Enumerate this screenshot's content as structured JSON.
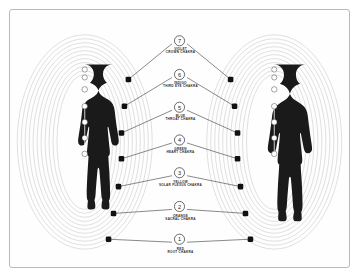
{
  "diagram": {
    "frame_color": "#b9b9bb",
    "background_color": "#fefefe",
    "silhouette_color": "#1a1a1a",
    "aura_line_color": "#c6c6c8",
    "leader_line_color": "#3a3a3a",
    "node_color": "#111111",
    "aura_ring_count": 11,
    "figures": [
      {
        "name": "female-figure",
        "position": "left"
      },
      {
        "name": "male-figure",
        "position": "right"
      }
    ],
    "chakras": [
      {
        "number": "7",
        "color_name": "VIOLET",
        "chakra_name": "CROWN CHAKRA",
        "y": 22
      },
      {
        "number": "6",
        "color_name": "INDIGO",
        "chakra_name": "THIRD EYE CHAKRA",
        "y": 56
      },
      {
        "number": "5",
        "color_name": "BLUE",
        "chakra_name": "THROAT CHAKRA",
        "y": 90
      },
      {
        "number": "4",
        "color_name": "GREEN",
        "chakra_name": "HEART CHAKRA",
        "y": 123
      },
      {
        "number": "3",
        "color_name": "YELLOW",
        "chakra_name": "SOLAR PLEXUS CHAKRA",
        "y": 156
      },
      {
        "number": "2",
        "color_name": "ORANGE",
        "chakra_name": "SACRAL CHAKRA",
        "y": 190
      },
      {
        "number": "1",
        "color_name": "RED",
        "chakra_name": "ROOT CHAKRA",
        "y": 223
      }
    ],
    "body_chakra_points": {
      "left_figure_x": 75,
      "right_figure_x": 266,
      "y_positions": [
        61,
        68,
        80,
        97,
        113,
        129,
        145
      ]
    }
  }
}
